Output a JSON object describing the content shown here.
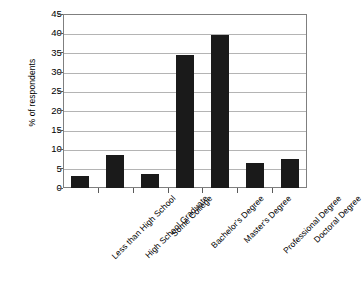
{
  "chart_data": {
    "type": "bar",
    "title": "",
    "subtitle": "",
    "xlabel": "",
    "ylabel": "% of respondents",
    "categories": [
      "Less than High School",
      "High School Graduate",
      "Some College",
      "Bachelor's Degree",
      "Master's Degree",
      "Professional Degree",
      "Doctoral Degree"
    ],
    "values": [
      3.1,
      8.5,
      3.7,
      34.5,
      39.6,
      6.5,
      7.4
    ],
    "ylim": [
      0,
      45
    ],
    "ytick_step": 5,
    "yticks": [
      45,
      40,
      35,
      30,
      25,
      20,
      15,
      10,
      5,
      0
    ],
    "grid": true,
    "grid_axis": "y",
    "legend": false,
    "legend_position": "none",
    "bar_color": "#1a1a1a",
    "grid_color": "#b4b4b4",
    "frame_color": "#7f7f7f",
    "background_color": "#ffffff",
    "xtick_label_rotation": -45
  }
}
